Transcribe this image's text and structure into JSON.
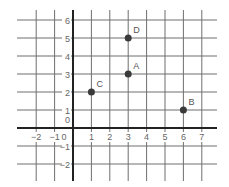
{
  "chart_data": {
    "type": "scatter",
    "title": "",
    "xlabel": "",
    "ylabel": "",
    "xlim": [
      -3,
      7.5
    ],
    "ylim": [
      -3,
      6.5
    ],
    "grid": true,
    "x_ticks": [
      -2,
      -1,
      0,
      1,
      2,
      3,
      4,
      5,
      6,
      7
    ],
    "y_ticks": [
      -2,
      -1,
      0,
      1,
      2,
      3,
      4,
      5,
      6
    ],
    "x_tick_labels": [
      "−2",
      "−1",
      "0",
      "1",
      "2",
      "3",
      "4",
      "5",
      "6",
      "7"
    ],
    "y_tick_labels": [
      "−2",
      "−1",
      "0",
      "1",
      "2",
      "3",
      "4",
      "5",
      "6"
    ],
    "points": [
      {
        "label": "A",
        "x": 3,
        "y": 3
      },
      {
        "label": "B",
        "x": 6,
        "y": 1
      },
      {
        "label": "C",
        "x": 1,
        "y": 2
      },
      {
        "label": "D",
        "x": 3,
        "y": 5
      }
    ]
  },
  "layout": {
    "origin_px": [
      73,
      128
    ],
    "unit_x_px": 18.4,
    "unit_y_px": 18.0,
    "grid_x_range_px": [
      17,
      217
    ],
    "grid_y_range_px": [
      10,
      181
    ],
    "colors": {
      "grid": "#6f6f6f",
      "axis": "#222222",
      "point": "#3a3a3a",
      "label": "#666666"
    }
  }
}
